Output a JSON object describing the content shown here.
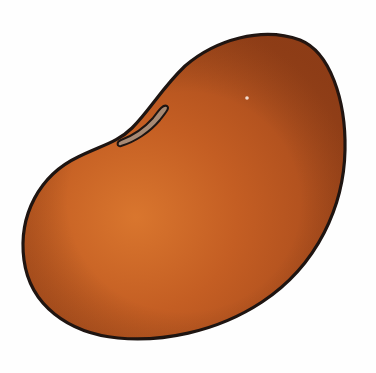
{
  "image": {
    "subject": "Kidney bean illustration",
    "background_color": "#ffffff",
    "colors": {
      "bean_base": "#b8521f",
      "bean_highlight": "#d9762e",
      "bean_shadow": "#9a4218",
      "outline": "#1e1512",
      "hilum_fill": "#a88a74",
      "specular": "#f3dcd0"
    }
  }
}
